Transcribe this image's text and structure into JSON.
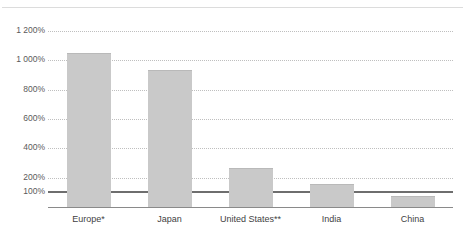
{
  "chart_data": {
    "type": "bar",
    "title": "",
    "xlabel": "",
    "ylabel": "",
    "categories": [
      "Europe*",
      "Japan",
      "United States**",
      "India",
      "China"
    ],
    "values": [
      1050,
      930,
      265,
      155,
      75
    ],
    "ylim": [
      0,
      1280
    ],
    "grid": true,
    "legend": null,
    "ytick_labels": [
      "1 200%",
      "1 000%",
      "800%",
      "600%",
      "400%",
      "200%",
      "100%"
    ],
    "ytick_values": [
      1200,
      1000,
      800,
      600,
      400,
      200,
      100
    ],
    "reference_line": {
      "value": 100,
      "label": "100%",
      "color": "#6e6e6e"
    },
    "bar_color": "#c9c9c9",
    "gridline_color": "#bfbfbf",
    "axis_color": "#8a8a8a",
    "series": [
      {
        "name": "",
        "values": [
          1050,
          930,
          265,
          155,
          75
        ]
      }
    ],
    "annotations": [
      "*",
      "**"
    ]
  },
  "frame": {
    "title_cropped": "",
    "top_rule_color": "#dcdcdc"
  }
}
